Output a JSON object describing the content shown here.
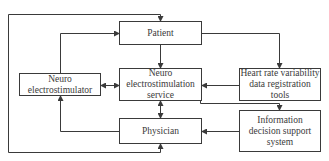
{
  "diagram": {
    "type": "flowchart",
    "colors": {
      "stroke": "#3a3a3a",
      "background": "#ffffff",
      "text": "#3a3a3a"
    },
    "nodes": {
      "patient": {
        "label": "Patient"
      },
      "neuro_electrostimulator": {
        "label": "Neuro electrostimulator"
      },
      "neuro_service": {
        "label": "Neuro electrostimulation service"
      },
      "hrv_tools": {
        "label": "Heart rate variability data registration tools"
      },
      "physician": {
        "label": "Physician"
      },
      "info_dss": {
        "label": "Information decision support system"
      }
    },
    "edges": [
      {
        "from": "neuro_electrostimulator",
        "to": "patient"
      },
      {
        "from": "patient",
        "to": "neuro_service"
      },
      {
        "from": "patient",
        "to": "hrv_tools"
      },
      {
        "from": "neuro_electrostimulator",
        "to": "neuro_service",
        "bidirectional": true
      },
      {
        "from": "hrv_tools",
        "to": "neuro_service"
      },
      {
        "from": "neuro_service",
        "to": "info_dss"
      },
      {
        "from": "neuro_service",
        "to": "physician",
        "bidirectional": true
      },
      {
        "from": "info_dss",
        "to": "physician"
      },
      {
        "from": "physician",
        "to": "neuro_electrostimulator"
      },
      {
        "from": "outer_loop",
        "to": "patient"
      },
      {
        "from": "outer_loop",
        "to": "physician"
      }
    ]
  }
}
